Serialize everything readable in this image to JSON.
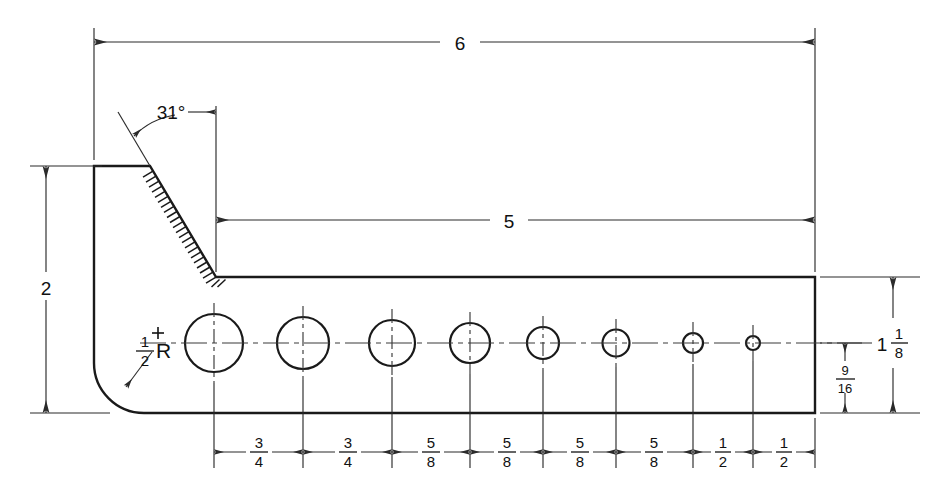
{
  "drawing": {
    "title": "Angle bracket with graduated hole pattern",
    "type": "engineering-orthographic-drawing",
    "units": "inches",
    "line_color": "#1a1a1a",
    "dimension_color": "#2b2b2b",
    "background_color": "#ffffff"
  },
  "dimensions": {
    "overall_length": {
      "label": "6",
      "description": "overall horizontal length, top dimension"
    },
    "shelf_length": {
      "label": "5",
      "description": "horizontal length from top of angled face to right edge"
    },
    "overall_height": {
      "label": "2",
      "description": "overall vertical height, left dimension"
    },
    "bevel_angle": {
      "label": "31°",
      "description": "angle of chamfered face from vertical"
    },
    "corner_radius": {
      "whole": "",
      "numerator": "1",
      "denominator": "2",
      "suffix": "R",
      "label": "1/2 R",
      "description": "bottom-left corner fillet radius"
    },
    "bar_height": {
      "whole": "1",
      "numerator": "1",
      "denominator": "8",
      "label": "1 1/8",
      "description": "right side overall bar height"
    },
    "center_to_bottom": {
      "whole": "",
      "numerator": "9",
      "denominator": "16",
      "label": "9/16",
      "description": "hole centerline to bottom edge"
    }
  },
  "hole_spacings": [
    {
      "whole": "",
      "numerator": "3",
      "denominator": "4",
      "label": "3/4"
    },
    {
      "whole": "",
      "numerator": "3",
      "denominator": "4",
      "label": "3/4"
    },
    {
      "whole": "",
      "numerator": "5",
      "denominator": "8",
      "label": "5/8"
    },
    {
      "whole": "",
      "numerator": "5",
      "denominator": "8",
      "label": "5/8"
    },
    {
      "whole": "",
      "numerator": "5",
      "denominator": "8",
      "label": "5/8"
    },
    {
      "whole": "",
      "numerator": "5",
      "denominator": "8",
      "label": "5/8"
    },
    {
      "whole": "",
      "numerator": "1",
      "denominator": "2",
      "label": "1/2"
    },
    {
      "whole": "",
      "numerator": "1",
      "denominator": "2",
      "label": "1/2"
    }
  ],
  "holes": [
    {
      "index": 1,
      "cx": 214,
      "cy": 343,
      "r": 29
    },
    {
      "index": 2,
      "cx": 303,
      "cy": 343,
      "r": 26
    },
    {
      "index": 3,
      "cx": 392,
      "cy": 343,
      "r": 23
    },
    {
      "index": 4,
      "cx": 470,
      "cy": 343,
      "r": 20
    },
    {
      "index": 5,
      "cx": 543,
      "cy": 343,
      "r": 16
    },
    {
      "index": 6,
      "cx": 616,
      "cy": 343,
      "r": 13.5
    },
    {
      "index": 7,
      "cx": 693,
      "cy": 343,
      "r": 10
    },
    {
      "index": 8,
      "cx": 753,
      "cy": 343,
      "r": 7
    }
  ],
  "geometry": {
    "part_left_x": 94,
    "part_right_x": 815,
    "part_top_y": 166,
    "part_bottom_y": 413,
    "shelf_top_y": 277,
    "bevel_top_x": 150,
    "bevel_bottom_x": 216,
    "fillet_radius": 50,
    "dim6_y": 42,
    "dim5_y": 220,
    "dim2_x": 46,
    "bottom_dim_y": 452
  }
}
